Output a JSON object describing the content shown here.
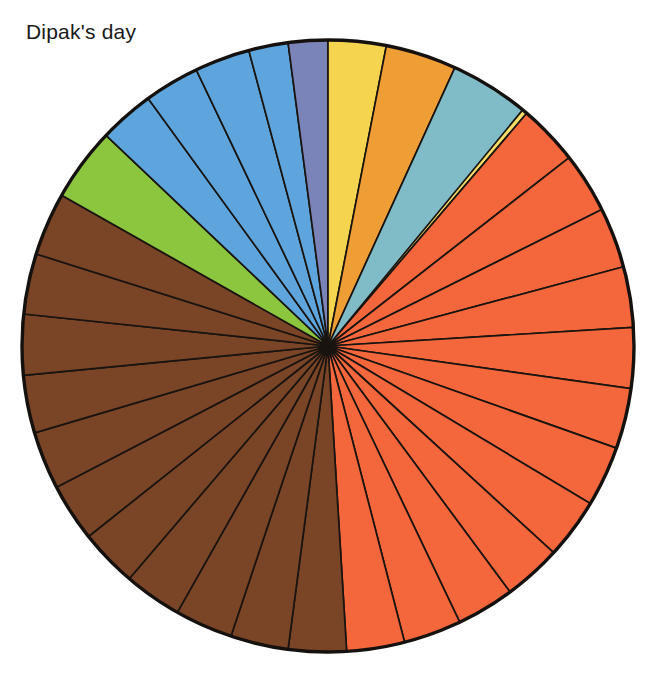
{
  "title": "Dipak's day",
  "chart_data": {
    "type": "pie",
    "title": "Dipak's day",
    "xlabel": "",
    "ylabel": "",
    "legend": "none",
    "grid": false,
    "start_angle_deg": 0,
    "direction": "clockwise",
    "center": {
      "x": 328,
      "y": 346
    },
    "radius": 306,
    "outline_color": "#15110e",
    "divider_color": "#191410",
    "background_color": "#ffffff",
    "total_units": 48,
    "unit_label": "half-hour",
    "palette": {
      "gold": "#b5872c",
      "yellow": "#f5d44f",
      "pale_yellow": "#f7dc6a",
      "red_orange": "#f4673c",
      "brown": "#7a4426",
      "green": "#8cc63f",
      "blue": "#5da5dc",
      "slate": "#7b84b8",
      "orange": "#ef9e36",
      "teal": "#7fbcc8"
    },
    "categories": [
      "gold",
      "yellow",
      "yellow",
      "yellow",
      "red_orange",
      "red_orange",
      "red_orange",
      "red_orange",
      "red_orange",
      "red_orange",
      "red_orange",
      "red_orange",
      "red_orange",
      "red_orange",
      "red_orange",
      "red_orange",
      "red_orange",
      "brown",
      "brown",
      "brown",
      "brown",
      "brown",
      "brown",
      "brown",
      "brown",
      "brown",
      "brown",
      "brown",
      "green",
      "blue",
      "blue",
      "blue",
      "blue",
      "slate",
      "yellow",
      "orange",
      "teal"
    ],
    "slices": [
      {
        "label": "gold",
        "color": "#b5872c",
        "start_deg": 0,
        "sweep_deg": 10.5,
        "value": 1.4
      },
      {
        "label": "yellow",
        "color": "#f5d44f",
        "start_deg": 10.5,
        "sweep_deg": 11.0,
        "value": 1.5
      },
      {
        "label": "yellow",
        "color": "#f5d44f",
        "start_deg": 21.5,
        "sweep_deg": 9.0,
        "value": 1.2
      },
      {
        "label": "pale-yellow",
        "color": "#f7dc6a",
        "start_deg": 30.5,
        "sweep_deg": 10.0,
        "value": 1.3
      },
      {
        "label": "red-orange",
        "color": "#f4673c",
        "start_deg": 40.5,
        "sweep_deg": 11.5,
        "value": 1.5
      },
      {
        "label": "red-orange",
        "color": "#f4673c",
        "start_deg": 52.0,
        "sweep_deg": 11.5,
        "value": 1.5
      },
      {
        "label": "red-orange",
        "color": "#f4673c",
        "start_deg": 63.5,
        "sweep_deg": 11.5,
        "value": 1.5
      },
      {
        "label": "red-orange",
        "color": "#f4673c",
        "start_deg": 75.0,
        "sweep_deg": 11.5,
        "value": 1.5
      },
      {
        "label": "red-orange",
        "color": "#f4673c",
        "start_deg": 86.5,
        "sweep_deg": 11.5,
        "value": 1.5
      },
      {
        "label": "red-orange",
        "color": "#f4673c",
        "start_deg": 98.0,
        "sweep_deg": 11.5,
        "value": 1.5
      },
      {
        "label": "red-orange",
        "color": "#f4673c",
        "start_deg": 109.5,
        "sweep_deg": 11.5,
        "value": 1.5
      },
      {
        "label": "red-orange",
        "color": "#f4673c",
        "start_deg": 121.0,
        "sweep_deg": 11.5,
        "value": 1.5
      },
      {
        "label": "red-orange",
        "color": "#f4673c",
        "start_deg": 132.5,
        "sweep_deg": 11.0,
        "value": 1.5
      },
      {
        "label": "red-orange",
        "color": "#f4673c",
        "start_deg": 143.5,
        "sweep_deg": 11.0,
        "value": 1.5
      },
      {
        "label": "red-orange",
        "color": "#f4673c",
        "start_deg": 154.5,
        "sweep_deg": 11.0,
        "value": 1.5
      },
      {
        "label": "red-orange",
        "color": "#f4673c",
        "start_deg": 165.5,
        "sweep_deg": 11.0,
        "value": 1.5
      },
      {
        "label": "brown",
        "color": "#7a4426",
        "start_deg": 176.5,
        "sweep_deg": 11.0,
        "value": 1.5
      },
      {
        "label": "brown",
        "color": "#7a4426",
        "start_deg": 187.5,
        "sweep_deg": 11.0,
        "value": 1.5
      },
      {
        "label": "brown",
        "color": "#7a4426",
        "start_deg": 198.5,
        "sweep_deg": 11.0,
        "value": 1.5
      },
      {
        "label": "brown",
        "color": "#7a4426",
        "start_deg": 209.5,
        "sweep_deg": 11.0,
        "value": 1.5
      },
      {
        "label": "brown",
        "color": "#7a4426",
        "start_deg": 220.5,
        "sweep_deg": 11.0,
        "value": 1.5
      },
      {
        "label": "brown",
        "color": "#7a4426",
        "start_deg": 231.5,
        "sweep_deg": 11.0,
        "value": 1.5
      },
      {
        "label": "brown",
        "color": "#7a4426",
        "start_deg": 242.5,
        "sweep_deg": 11.0,
        "value": 1.5
      },
      {
        "label": "brown",
        "color": "#7a4426",
        "start_deg": 253.5,
        "sweep_deg": 11.0,
        "value": 1.5
      },
      {
        "label": "brown",
        "color": "#7a4426",
        "start_deg": 264.5,
        "sweep_deg": 11.5,
        "value": 1.5
      },
      {
        "label": "brown",
        "color": "#7a4426",
        "start_deg": 276.0,
        "sweep_deg": 11.5,
        "value": 1.5
      },
      {
        "label": "brown",
        "color": "#7a4426",
        "start_deg": 287.5,
        "sweep_deg": 12.0,
        "value": 1.6
      },
      {
        "label": "green",
        "color": "#8cc63f",
        "start_deg": 299.5,
        "sweep_deg": 14.0,
        "value": 1.9
      },
      {
        "label": "blue",
        "color": "#5da5dc",
        "start_deg": 313.5,
        "sweep_deg": 10.5,
        "value": 1.4
      },
      {
        "label": "blue",
        "color": "#5da5dc",
        "start_deg": 324.0,
        "sweep_deg": 10.5,
        "value": 1.4
      },
      {
        "label": "blue",
        "color": "#5da5dc",
        "start_deg": 334.5,
        "sweep_deg": 10.5,
        "value": 1.4
      },
      {
        "label": "blue",
        "color": "#5da5dc",
        "start_deg": 345.0,
        "sweep_deg": 7.5,
        "value": 1.0
      },
      {
        "label": "slate",
        "color": "#7b84b8",
        "start_deg": 352.5,
        "sweep_deg": 7.5,
        "value": 1.0
      },
      {
        "label": "yellow",
        "color": "#f5d44f",
        "start_deg": 0.0,
        "sweep_deg": 11.0,
        "value": 1.5
      },
      {
        "label": "orange",
        "color": "#ef9e36",
        "start_deg": 11.0,
        "sweep_deg": 13.5,
        "value": 1.8
      },
      {
        "label": "teal",
        "color": "#7fbcc8",
        "start_deg": 24.5,
        "sweep_deg": 15.0,
        "value": 2.0
      }
    ]
  }
}
